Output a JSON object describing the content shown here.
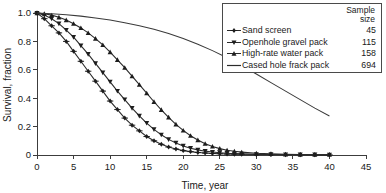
{
  "chart_data": {
    "type": "line",
    "title": "",
    "xlabel": "Time, year",
    "ylabel": "Survival, fraction",
    "xlim": [
      0,
      45
    ],
    "ylim": [
      0,
      1.0
    ],
    "xticks": [
      0,
      5,
      10,
      15,
      20,
      25,
      30,
      35,
      40,
      45
    ],
    "xtick_labels": [
      "0",
      "5",
      "10",
      "15",
      "20",
      "25",
      "30",
      "35",
      "40",
      "45"
    ],
    "yticks": [
      0,
      0.2,
      0.4,
      0.6,
      0.8,
      1.0
    ],
    "ytick_labels": [
      "0",
      "0.2",
      "0.4",
      "0.6",
      "0.8",
      "1.0"
    ],
    "grid": false,
    "legend_position": "top-right",
    "legend_header": "Sample\nsize",
    "legend_header_line1": "Sample",
    "legend_header_line2": "size",
    "series": [
      {
        "name": "Sand screen",
        "sample_size": "45",
        "marker": "plus-diamond",
        "has_markers": true,
        "x": [
          0,
          1,
          2,
          3,
          4,
          5,
          6,
          7,
          8,
          9,
          10,
          11,
          12,
          13,
          14,
          15,
          16,
          17,
          18,
          19,
          20,
          21,
          22,
          23,
          24,
          25,
          26,
          27,
          28,
          30,
          32,
          34,
          36,
          38,
          40
        ],
        "values": [
          1.0,
          0.96,
          0.91,
          0.86,
          0.8,
          0.73,
          0.66,
          0.59,
          0.52,
          0.45,
          0.38,
          0.32,
          0.26,
          0.21,
          0.17,
          0.13,
          0.1,
          0.075,
          0.056,
          0.042,
          0.031,
          0.024,
          0.018,
          0.014,
          0.011,
          0.009,
          0.007,
          0.006,
          0.005,
          0.004,
          0.003,
          0.002,
          0.002,
          0.001,
          0.001
        ]
      },
      {
        "name": "Openhole gravel pack",
        "sample_size": "115",
        "marker": "triangle-down",
        "has_markers": true,
        "x": [
          0,
          1,
          2,
          3,
          4,
          5,
          6,
          7,
          8,
          9,
          10,
          11,
          12,
          13,
          14,
          15,
          16,
          17,
          18,
          19,
          20,
          21,
          22,
          23,
          24,
          25,
          26,
          27,
          28,
          30,
          32,
          34,
          36,
          38,
          40
        ],
        "values": [
          1.0,
          0.985,
          0.96,
          0.925,
          0.88,
          0.83,
          0.77,
          0.71,
          0.645,
          0.58,
          0.515,
          0.45,
          0.39,
          0.33,
          0.275,
          0.225,
          0.18,
          0.142,
          0.11,
          0.085,
          0.064,
          0.048,
          0.036,
          0.027,
          0.021,
          0.016,
          0.012,
          0.01,
          0.008,
          0.005,
          0.004,
          0.003,
          0.002,
          0.002,
          0.001
        ]
      },
      {
        "name": "High-rate water pack",
        "sample_size": "158",
        "marker": "triangle-up",
        "has_markers": true,
        "x": [
          0,
          1,
          2,
          3,
          4,
          5,
          6,
          7,
          8,
          9,
          10,
          11,
          12,
          13,
          14,
          15,
          16,
          17,
          18,
          19,
          20,
          21,
          22,
          23,
          24,
          25,
          26,
          27,
          28,
          30,
          32,
          34,
          36,
          38,
          40
        ],
        "values": [
          1.0,
          0.995,
          0.985,
          0.97,
          0.95,
          0.925,
          0.895,
          0.86,
          0.82,
          0.775,
          0.725,
          0.67,
          0.615,
          0.555,
          0.495,
          0.435,
          0.375,
          0.318,
          0.265,
          0.216,
          0.173,
          0.136,
          0.105,
          0.08,
          0.06,
          0.045,
          0.034,
          0.026,
          0.02,
          0.012,
          0.008,
          0.005,
          0.003,
          0.002,
          0.002
        ]
      },
      {
        "name": "Cased hole frack pack",
        "sample_size": "694",
        "marker": "line",
        "has_markers": false,
        "x": [
          0,
          2,
          4,
          6,
          8,
          10,
          12,
          14,
          16,
          18,
          20,
          22,
          24,
          26,
          28,
          30,
          32,
          34,
          36,
          38,
          40
        ],
        "values": [
          1.0,
          0.995,
          0.988,
          0.978,
          0.965,
          0.95,
          0.932,
          0.91,
          0.885,
          0.855,
          0.82,
          0.78,
          0.735,
          0.685,
          0.63,
          0.57,
          0.51,
          0.45,
          0.39,
          0.33,
          0.275
        ]
      }
    ]
  }
}
